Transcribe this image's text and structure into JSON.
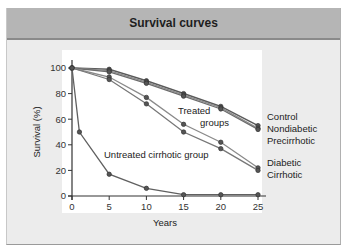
{
  "header": {
    "title": "Survival curves"
  },
  "colors": {
    "title_bar": "#b5b5b5",
    "panel": "#ececec",
    "plot_bg": "#ffffff",
    "line_dark": "#555555",
    "line_light": "#8a8a8a",
    "marker": "#444444"
  },
  "chart_data": {
    "type": "line",
    "title": "Survival curves",
    "xlabel": "Years",
    "ylabel": "Survival (%)",
    "xlim": [
      0,
      25
    ],
    "ylim": [
      0,
      100
    ],
    "xticks": [
      0,
      5,
      10,
      15,
      20,
      25
    ],
    "yticks": [
      0,
      20,
      40,
      60,
      80,
      100
    ],
    "grid": false,
    "annotations": [
      "Treated groups",
      "Untreated cirrhotic group"
    ],
    "legend_position": "right (inline labels)",
    "series": [
      {
        "name": "Control",
        "x": [
          0,
          5,
          10,
          15,
          20,
          25
        ],
        "values": [
          100,
          99,
          90,
          80,
          70,
          55
        ]
      },
      {
        "name": "Nondiabetic",
        "x": [
          0,
          5,
          10,
          15,
          20,
          25
        ],
        "values": [
          100,
          98,
          89,
          79,
          69,
          53
        ]
      },
      {
        "name": "Precirrhotic",
        "x": [
          0,
          5,
          10,
          15,
          20,
          25
        ],
        "values": [
          100,
          97,
          88,
          78,
          68,
          52
        ]
      },
      {
        "name": "Diabetic",
        "x": [
          0,
          5,
          10,
          15,
          20,
          25
        ],
        "values": [
          100,
          93,
          77,
          56,
          42,
          22
        ]
      },
      {
        "name": "Cirrhotic",
        "x": [
          0,
          5,
          10,
          15,
          20,
          25
        ],
        "values": [
          100,
          91,
          72,
          50,
          37,
          20
        ]
      },
      {
        "name": "Untreated cirrhotic group",
        "x": [
          0,
          1,
          5,
          10,
          15,
          20,
          25
        ],
        "values": [
          100,
          50,
          17,
          6,
          1,
          1,
          1
        ]
      }
    ],
    "right_labels": {
      "group1": [
        "Control",
        "Nondiabetic",
        "Precirrhotic"
      ],
      "group2": [
        "Diabetic",
        "Cirrhotic"
      ]
    },
    "inline_labels": {
      "treated_line1": "Treated",
      "treated_line2": "groups",
      "untreated": "Untreated cirrhotic group"
    }
  }
}
